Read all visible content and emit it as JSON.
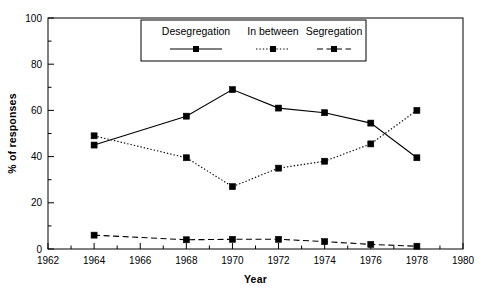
{
  "chart_data": {
    "type": "line",
    "title": "",
    "xlabel": "Year",
    "ylabel": "% of responses",
    "x": [
      1964,
      1968,
      1970,
      1972,
      1974,
      1976,
      1978
    ],
    "xlim": [
      1962,
      1980
    ],
    "ylim": [
      0,
      100
    ],
    "xticks": [
      1962,
      1964,
      1966,
      1968,
      1970,
      1972,
      1974,
      1976,
      1978,
      1980
    ],
    "xtick_labels": [
      "1962",
      "1964",
      "1966",
      "1968",
      "1970",
      "1972",
      "1974",
      "1976",
      "1978",
      "1980"
    ],
    "yticks": [
      0,
      20,
      40,
      60,
      80,
      100
    ],
    "ytick_labels": [
      "0",
      "20",
      "40",
      "60",
      "80",
      "100"
    ],
    "minor_xticks": [
      1963,
      1965,
      1967,
      1969,
      1971,
      1973,
      1975,
      1977,
      1979
    ],
    "minor_yticks": [
      10,
      30,
      50,
      70,
      90
    ],
    "grid": false,
    "legend_position": "top-center",
    "series": [
      {
        "name": "Desegregation",
        "linestyle": "solid",
        "marker": "square",
        "color": "#000000",
        "values": [
          45,
          57.5,
          69,
          61,
          59,
          54.5,
          39.5
        ]
      },
      {
        "name": "In between",
        "linestyle": "dotted",
        "marker": "square",
        "color": "#000000",
        "values": [
          49,
          39.5,
          27,
          35,
          38,
          45.5,
          60
        ]
      },
      {
        "name": "Segregation",
        "linestyle": "dashed",
        "marker": "square",
        "color": "#000000",
        "values": [
          6,
          4,
          4.2,
          4.2,
          3.2,
          2,
          1.2
        ]
      }
    ]
  },
  "legend": {
    "entries": [
      {
        "label": "Desegregation",
        "style": "solid"
      },
      {
        "label": "In between",
        "style": "dotted"
      },
      {
        "label": "Segregation",
        "style": "dashed"
      }
    ]
  },
  "axes": {
    "x_title": "Year",
    "y_title": "% of responses"
  }
}
